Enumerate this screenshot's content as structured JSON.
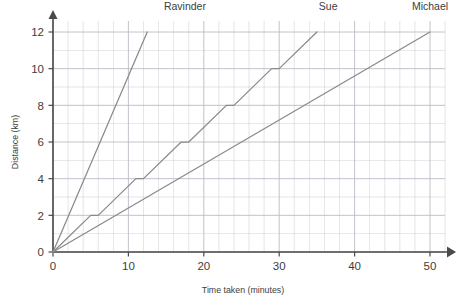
{
  "chart_data": {
    "type": "line",
    "title": "",
    "xlabel": "Time taken (minutes)",
    "ylabel": "Distance (km)",
    "xlim": [
      0,
      52
    ],
    "ylim": [
      0,
      12.6
    ],
    "xticks": [
      0,
      10,
      20,
      30,
      40,
      50
    ],
    "yticks": [
      0,
      2,
      4,
      6,
      8,
      10,
      12
    ],
    "xtick_labels": [
      "0",
      "10",
      "20",
      "30",
      "40",
      "50"
    ],
    "ytick_labels": [
      "0",
      "2",
      "4",
      "6",
      "8",
      "10",
      "12"
    ],
    "x_minor_step": 2,
    "y_minor_step": 1,
    "grid": true,
    "legend": "inline-end-labels",
    "line_color": "#8a8a8a",
    "grid_color": "#b9b9c4",
    "axis_color": "#4a4a4a",
    "series": [
      {
        "name": "Ravinder",
        "label": "Ravinder",
        "label_x": 17.5,
        "label_y": 13.2,
        "points": [
          [
            0,
            0
          ],
          [
            12.5,
            12
          ]
        ]
      },
      {
        "name": "Sue",
        "label": "Sue",
        "label_x": 36.5,
        "label_y": 13.2,
        "points": [
          [
            0,
            0
          ],
          [
            5,
            2
          ],
          [
            6,
            2
          ],
          [
            11,
            4
          ],
          [
            12,
            4
          ],
          [
            17,
            6
          ],
          [
            18,
            6
          ],
          [
            23,
            8
          ],
          [
            24,
            8
          ],
          [
            29,
            10
          ],
          [
            30,
            10
          ],
          [
            35,
            12
          ]
        ]
      },
      {
        "name": "Michael",
        "label": "Michael",
        "label_x": 50,
        "label_y": 13.2,
        "points": [
          [
            0,
            0
          ],
          [
            50,
            12
          ]
        ]
      }
    ]
  }
}
